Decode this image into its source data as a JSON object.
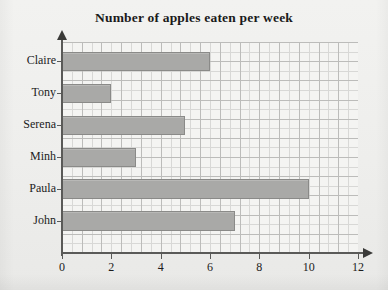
{
  "chart_data": {
    "type": "bar",
    "orientation": "horizontal",
    "title": "Number of apples eaten per week",
    "xlabel": "",
    "ylabel": "",
    "categories": [
      "Claire",
      "Tony",
      "Serena",
      "Minh",
      "Paula",
      "John"
    ],
    "values": [
      6,
      2,
      5,
      3,
      10,
      7
    ],
    "xlim": [
      0,
      12
    ],
    "xticks": [
      0,
      2,
      4,
      6,
      8,
      10,
      12
    ],
    "xtick_labels": [
      "0",
      "2",
      "4",
      "6",
      "8",
      "10",
      "12"
    ],
    "grid": true,
    "grid_minor_step": 0.5,
    "grid_major_step": 1,
    "legend": false,
    "bar_color": "#a9a9a7",
    "bar_border_color": "#8a8a88",
    "axis_color": "#5a5a58",
    "grid_color": "#d8d8d6",
    "grid_major_color": "#bcbcba",
    "background_color": "#efefed",
    "plot_background_color": "#f4f4f2",
    "title_color": "#1a1a1a",
    "label_color": "#1c1c1c"
  }
}
